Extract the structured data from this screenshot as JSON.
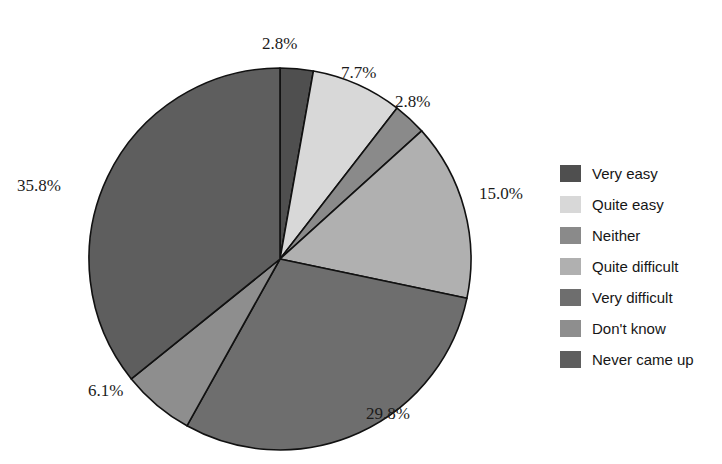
{
  "chart_data": {
    "type": "pie",
    "title": "",
    "subtitle": "",
    "xlabel": "",
    "ylabel": "",
    "legend_position": "right",
    "grid": false,
    "start_angle_deg": 0,
    "direction": "clockwise",
    "categories": [
      "Very easy",
      "Quite easy",
      "Neither",
      "Quite difficult",
      "Very difficult",
      "Don't know",
      "Never came up"
    ],
    "values": [
      2.8,
      7.7,
      2.8,
      15.0,
      29.8,
      6.1,
      35.8
    ],
    "value_labels": [
      "2.8%",
      "7.7%",
      "2.8%",
      "15.0%",
      "29.8%",
      "6.1%",
      "35.8%"
    ],
    "colors": [
      "#4f4f4f",
      "#d8d8d8",
      "#8a8a8a",
      "#b0b0b0",
      "#6e6e6e",
      "#8e8e8e",
      "#5e5e5e"
    ],
    "slice_edge_color": "#111111",
    "total": 100.0
  },
  "labels": {
    "very_easy": "2.8%",
    "quite_easy": "7.7%",
    "neither": "2.8%",
    "quite_difficult": "15.0%",
    "very_difficult": "29.8%",
    "dont_know": "6.1%",
    "never_came_up": "35.8%"
  },
  "legend": {
    "items": [
      {
        "label": "Very easy",
        "color": "#4f4f4f"
      },
      {
        "label": "Quite easy",
        "color": "#d8d8d8"
      },
      {
        "label": "Neither",
        "color": "#8a8a8a"
      },
      {
        "label": "Quite difficult",
        "color": "#b0b0b0"
      },
      {
        "label": "Very difficult",
        "color": "#6e6e6e"
      },
      {
        "label": "Don't know",
        "color": "#8e8e8e"
      },
      {
        "label": "Never came up",
        "color": "#5e5e5e"
      }
    ]
  }
}
